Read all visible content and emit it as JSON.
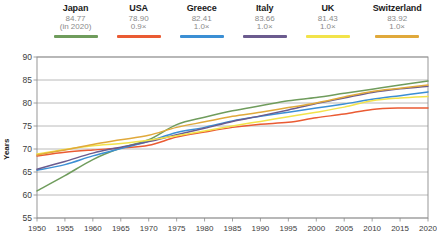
{
  "legend": {
    "items": [
      {
        "name": "Japan",
        "value": "84.77",
        "sub": "(in 2020)",
        "color": "#6f9c5c"
      },
      {
        "name": "USA",
        "value": "78.90",
        "sub": "0.9×",
        "color": "#ea5b33"
      },
      {
        "name": "Greece",
        "value": "82.41",
        "sub": "1.0×",
        "color": "#3b8fd4"
      },
      {
        "name": "Italy",
        "value": "83.66",
        "sub": "1.0×",
        "color": "#6b5b8e"
      },
      {
        "name": "UK",
        "value": "81.43",
        "sub": "1.0×",
        "color": "#f2e34a"
      },
      {
        "name": "Switzerland",
        "value": "83.92",
        "sub": "1.0×",
        "color": "#e0a93b"
      }
    ]
  },
  "chart_data": {
    "type": "line",
    "title": "",
    "xlabel": "",
    "ylabel": "Years",
    "xlim": [
      1950,
      2020
    ],
    "ylim": [
      55,
      90
    ],
    "grid": true,
    "legend_position": "top",
    "xticks": [
      1950,
      1955,
      1960,
      1965,
      1970,
      1975,
      1980,
      1985,
      1990,
      1995,
      2000,
      2005,
      2010,
      2015,
      2020
    ],
    "yticks": [
      55,
      60,
      65,
      70,
      75,
      80,
      85,
      90
    ],
    "x": [
      1950,
      1955,
      1960,
      1965,
      1970,
      1975,
      1980,
      1985,
      1990,
      1995,
      2000,
      2005,
      2010,
      2015,
      2020
    ],
    "series": [
      {
        "name": "Japan",
        "color": "#6f9c5c",
        "values": [
          60.9,
          64.2,
          67.7,
          70.2,
          72.0,
          75.3,
          76.9,
          78.3,
          79.4,
          80.5,
          81.2,
          82.1,
          83.0,
          83.9,
          84.77
        ]
      },
      {
        "name": "USA",
        "color": "#ea5b33",
        "values": [
          68.5,
          69.3,
          69.8,
          70.2,
          70.8,
          72.6,
          73.7,
          74.7,
          75.4,
          75.8,
          76.8,
          77.6,
          78.6,
          78.9,
          78.9
        ]
      },
      {
        "name": "Greece",
        "color": "#3b8fd4",
        "values": [
          65.4,
          66.6,
          68.5,
          70.1,
          71.7,
          73.6,
          74.7,
          76.1,
          77.1,
          78.0,
          78.9,
          79.8,
          80.8,
          81.6,
          82.41
        ]
      },
      {
        "name": "Italy",
        "color": "#6b5b8e",
        "values": [
          65.6,
          67.3,
          69.1,
          70.4,
          71.6,
          73.1,
          74.5,
          76.0,
          77.2,
          78.5,
          79.9,
          81.1,
          82.3,
          83.1,
          83.66
        ]
      },
      {
        "name": "UK",
        "color": "#f2e34a",
        "values": [
          68.9,
          69.9,
          70.7,
          71.2,
          71.9,
          72.9,
          73.9,
          75.0,
          76.0,
          77.0,
          78.0,
          79.1,
          80.5,
          81.1,
          81.43
        ]
      },
      {
        "name": "Switzerland",
        "color": "#e0a93b",
        "values": [
          68.7,
          69.8,
          71.0,
          72.0,
          73.0,
          74.7,
          75.9,
          77.1,
          78.0,
          79.0,
          80.0,
          81.3,
          82.5,
          83.2,
          83.92
        ]
      }
    ]
  }
}
